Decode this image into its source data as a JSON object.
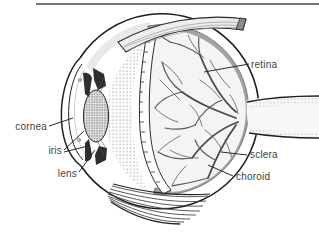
{
  "meta": {
    "background": "#ffffff"
  },
  "divider": {
    "color": "#4a4a4a"
  },
  "labels": {
    "cornea": "cornea",
    "iris": "iris",
    "lens": "lens",
    "retina": "retina",
    "sclera": "sclera",
    "choroid": "choroid"
  },
  "colors": {
    "ink": "#1c1c1c",
    "choroid_band": "#a3a3a3",
    "vessel": "#555555",
    "muscle_fill": "#ededed",
    "shading": "#e3e3e3",
    "label_text": "#3f3f3f"
  }
}
